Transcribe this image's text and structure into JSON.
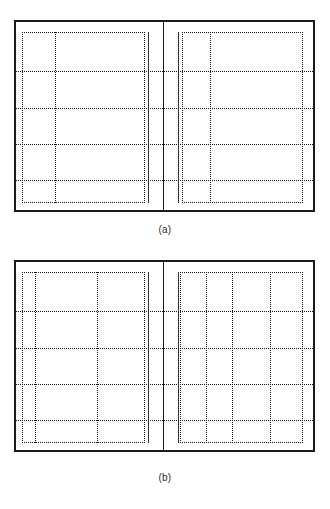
{
  "document": {
    "kind": "technical-line-diagram",
    "background_color": "#ffffff",
    "line_color": "#151515",
    "frame_color": "#1a1a1a",
    "solid_line_color": "#303030",
    "width": 330,
    "height": 509
  },
  "figures": [
    {
      "id": "figure-a",
      "caption": "(a)",
      "caption_y": 231,
      "frame": {
        "x": 14,
        "y": 20,
        "width": 301,
        "height": 192
      },
      "center_divider_x": 163,
      "horizontal_dotted_lines_y": [
        71,
        108,
        144,
        180
      ],
      "panels": [
        {
          "id": "panel-a-left",
          "solid_vertical_x": 148,
          "dotted_region": {
            "x": 22,
            "y": 32,
            "width": 123,
            "height": 171
          },
          "inner_vertical_dotted_x": [
            55
          ]
        },
        {
          "id": "panel-a-right",
          "solid_vertical_x": 178,
          "dotted_region": {
            "x": 182,
            "y": 32,
            "width": 121,
            "height": 171
          },
          "inner_vertical_dotted_x": [
            210
          ]
        }
      ]
    },
    {
      "id": "figure-b",
      "caption": "(b)",
      "caption_y": 479,
      "frame": {
        "x": 14,
        "y": 260,
        "width": 301,
        "height": 192
      },
      "center_divider_x": 163,
      "horizontal_dotted_lines_y": [
        311,
        348,
        384,
        420
      ],
      "panels": [
        {
          "id": "panel-b-left",
          "solid_vertical_x": 148,
          "dotted_region": {
            "x": 22,
            "y": 272,
            "width": 123,
            "height": 171
          },
          "inner_vertical_dotted_x": [
            35,
            97
          ]
        },
        {
          "id": "panel-b-right",
          "solid_vertical_x": 178,
          "dotted_region": {
            "x": 180,
            "y": 272,
            "width": 123,
            "height": 171
          },
          "inner_vertical_dotted_x": [
            206,
            232,
            270
          ]
        }
      ]
    }
  ]
}
